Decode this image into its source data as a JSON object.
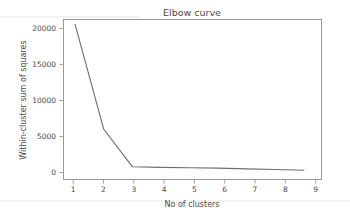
{
  "figure": {
    "background_color": "#ffffff",
    "frame_color": "#999999",
    "text_color": "#4a4a4a"
  },
  "chart_data": {
    "type": "line",
    "title": "Elbow curve",
    "xlabel": "No of clusters",
    "ylabel": "Within-cluster sum  of squares",
    "x": [
      1,
      2,
      3,
      4,
      5,
      6,
      7,
      8,
      9
    ],
    "values": [
      21300,
      6500,
      1200,
      1100,
      1050,
      1000,
      900,
      800,
      700
    ],
    "series": [
      {
        "name": "WCSS",
        "color": "#6e6e6e",
        "values": [
          21300,
          6500,
          1200,
          1100,
          1050,
          1000,
          900,
          800,
          700
        ]
      }
    ],
    "xlim": [
      0.6,
      9.6
    ],
    "ylim": [
      -600,
      21900
    ],
    "xticks": [
      1,
      2,
      3,
      4,
      5,
      6,
      7,
      8,
      9
    ],
    "xticklabels": [
      "1",
      "2",
      "3",
      "4",
      "5",
      "6",
      "7",
      "8",
      "9"
    ],
    "yticks": [
      0,
      5000,
      10000,
      15000,
      20000
    ],
    "yticklabels": [
      "0",
      "5000",
      "10000",
      "15000",
      "20000"
    ],
    "grid": false,
    "legend": null,
    "annotations": []
  }
}
